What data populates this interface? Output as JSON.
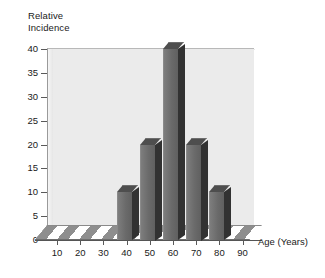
{
  "chart_data": {
    "type": "bar",
    "title": "",
    "ylabel": "Relative\nIncidence",
    "ylabel_line1": "Relative",
    "ylabel_line2": "Incidence",
    "xlabel": "Age (Years)",
    "categories": [
      "10",
      "20",
      "30",
      "40",
      "50",
      "60",
      "70",
      "80",
      "90"
    ],
    "values": [
      0,
      0,
      0,
      10,
      20,
      40,
      20,
      10,
      0
    ],
    "xtick_labels": [
      "10",
      "20",
      "30",
      "40",
      "50",
      "60",
      "70",
      "80",
      "90"
    ],
    "ytick_labels": [
      "0",
      "5",
      "10",
      "15",
      "20",
      "25",
      "30",
      "35",
      "40"
    ],
    "ylim": [
      0,
      40
    ],
    "ytick_step": 5,
    "grid": false,
    "legend": null,
    "style": "3d-column",
    "colors": {
      "bar_face": "#6a6a6a",
      "bar_side": "#323232",
      "bar_top": "#4e4e4e",
      "plot_background": "#ebebeb",
      "floor_hatch": "#8e8e8e",
      "text": "#1a1a1a"
    }
  }
}
